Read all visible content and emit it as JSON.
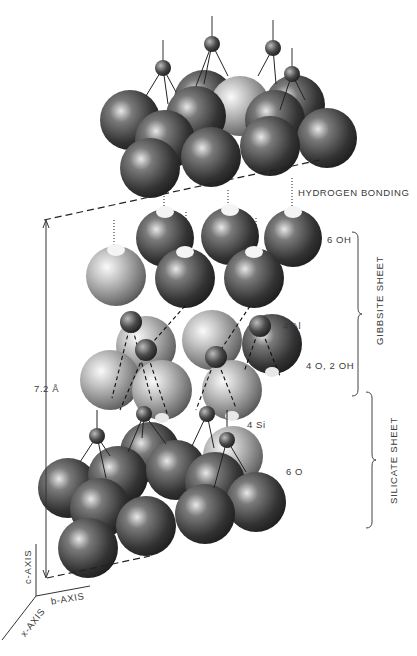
{
  "figure": {
    "labels": {
      "hydrogen_bonding": "HYDROGEN BONDING",
      "six_oh": "6 OH",
      "four_al": "4 Al",
      "four_o_two_oh": "4 O, 2 OH",
      "four_si": "4 Si",
      "six_o": "6 O",
      "gibbsite_sheet": "GIBBSITE SHEET",
      "silicate_sheet": "SILICATE SHEET",
      "spacing": "7.2 Å"
    },
    "axes": {
      "c": "c-AXIS",
      "b": "b-AXIS",
      "a": "x-AXIS"
    },
    "colors": {
      "oxygen": "#3a3a3a",
      "hydroxyl": "#8a8a8a",
      "cation": "#2a2a2a",
      "line": "#222222"
    }
  }
}
